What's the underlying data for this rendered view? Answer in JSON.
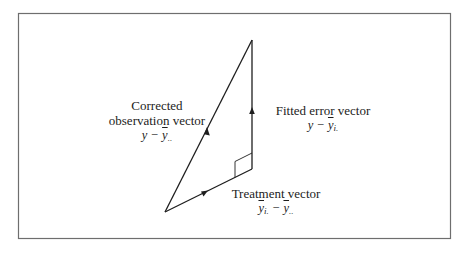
{
  "diagram": {
    "type": "vector-triangle",
    "frame": {
      "x": 18,
      "y": 13,
      "width": 432,
      "height": 225,
      "stroke": "#6e6e6e"
    },
    "colors": {
      "line": "#1e1e1e",
      "frame": "#6e6e6e",
      "background": "#ffffff"
    },
    "vertices": {
      "origin": {
        "x": 165,
        "y": 212
      },
      "right_angle": {
        "x": 252,
        "y": 169
      },
      "apex": {
        "x": 252,
        "y": 40
      }
    },
    "vectors": [
      {
        "id": "corrected-observation",
        "from": "origin",
        "to": "apex",
        "title_line1": "Corrected",
        "title_line2": "observation vector",
        "math_base": "y − ",
        "math_bar": "y",
        "math_sub": ".."
      },
      {
        "id": "fitted-error",
        "from": "right_angle",
        "to": "apex",
        "title_line1": "Fitted error vector",
        "math_base": "y − ",
        "math_bar": "y",
        "math_sub": "i."
      },
      {
        "id": "treatment",
        "from": "origin",
        "to": "right_angle",
        "title_line1": "Treatment vector",
        "math_bar1": "y",
        "math_sub1": "i.",
        "math_minus": " − ",
        "math_bar2": "y",
        "math_sub2": ".."
      }
    ],
    "right_angle_marker": true
  }
}
